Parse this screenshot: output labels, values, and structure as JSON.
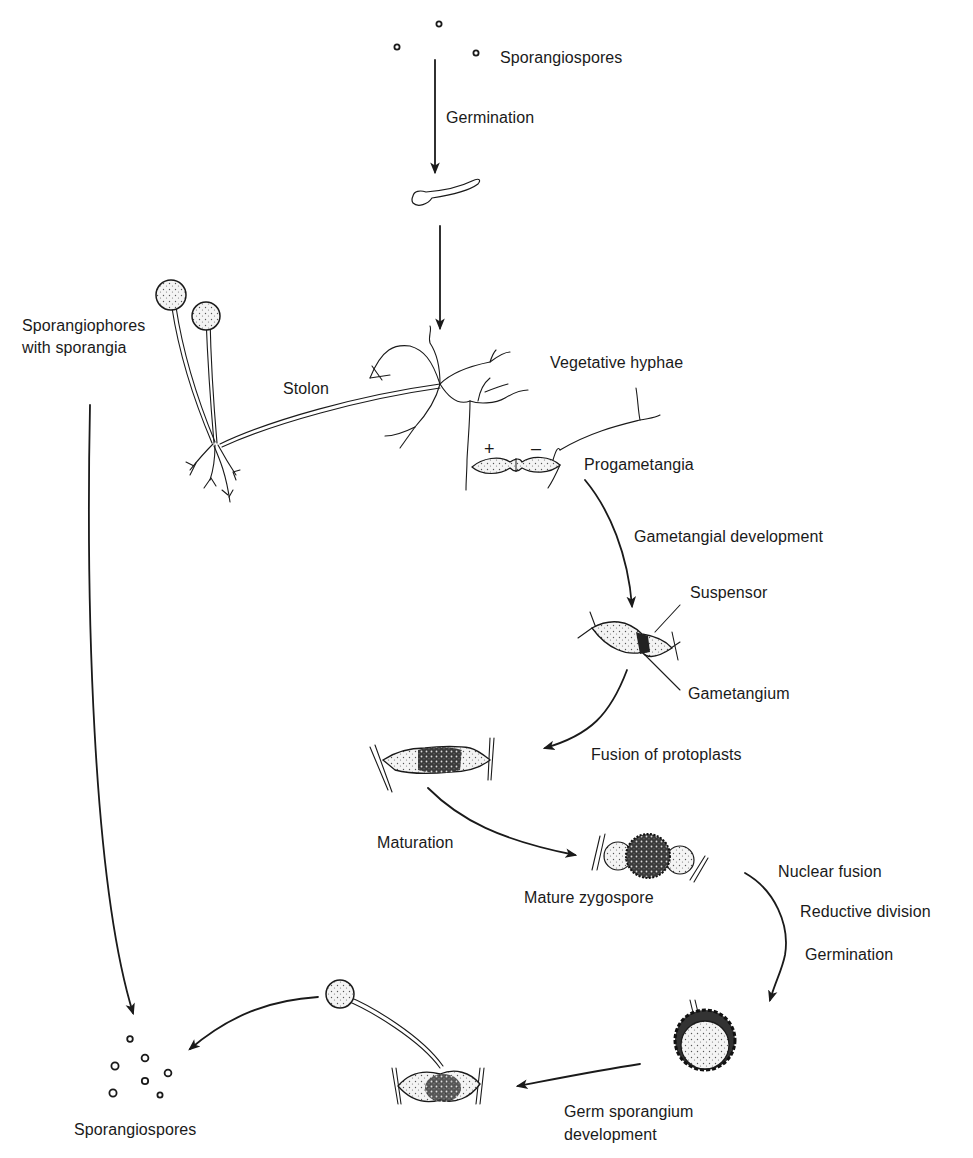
{
  "diagram": {
    "type": "life-cycle",
    "stages": [
      {
        "id": "spores_top",
        "label": "Sporangiospores"
      },
      {
        "id": "germ_tube",
        "label": ""
      },
      {
        "id": "mycelium",
        "label": "Vegetative hyphae"
      },
      {
        "id": "sporangiophores",
        "label": "Sporangiophores\nwith sporangia"
      },
      {
        "id": "progametangia",
        "label": "Progametangia"
      },
      {
        "id": "gametangia",
        "label": ""
      },
      {
        "id": "fused",
        "label": ""
      },
      {
        "id": "zygospore",
        "label": "Mature zygospore"
      },
      {
        "id": "germinating_zygospore",
        "label": ""
      },
      {
        "id": "germ_sporangium",
        "label": ""
      },
      {
        "id": "spores_bottom",
        "label": "Sporangiospores"
      }
    ],
    "transitions": [
      {
        "from": "spores_top",
        "to": "germ_tube",
        "label": "Germination"
      },
      {
        "from": "germ_tube",
        "to": "mycelium",
        "label": ""
      },
      {
        "from": "progametangia",
        "to": "gametangia",
        "label": "Gametangial development"
      },
      {
        "from": "gametangia",
        "to": "fused",
        "label": "Fusion of protoplasts"
      },
      {
        "from": "fused",
        "to": "zygospore",
        "label": "Maturation"
      },
      {
        "from": "zygospore",
        "to": "germinating_zygospore",
        "label": "Nuclear fusion / Reductive division / Germination"
      },
      {
        "from": "germinating_zygospore",
        "to": "germ_sporangium",
        "label": "Germ sporangium development"
      },
      {
        "from": "germ_sporangium",
        "to": "spores_bottom",
        "label": ""
      },
      {
        "from": "sporangiophores",
        "to": "spores_bottom",
        "label": ""
      }
    ]
  },
  "labels": {
    "sporangiospores_top": "Sporangiospores",
    "germination_top": "Germination",
    "sporangiophores_line1": "Sporangiophores",
    "sporangiophores_line2": "with sporangia",
    "stolon": "Stolon",
    "vegetative_hyphae": "Vegetative hyphae",
    "plus_sign": "+",
    "minus_sign": "–",
    "progametangia": "Progametangia",
    "gametangial_development": "Gametangial development",
    "suspensor": "Suspensor",
    "gametangium": "Gametangium",
    "fusion_of_protoplasts": "Fusion of protoplasts",
    "maturation": "Maturation",
    "mature_zygospore": "Mature zygospore",
    "nuclear_fusion": "Nuclear fusion",
    "reductive_division": "Reductive division",
    "germination_bottom": "Germination",
    "germ_sporangium_line1": "Germ sporangium",
    "germ_sporangium_line2": "development",
    "sporangiospores_bottom": "Sporangiospores"
  }
}
